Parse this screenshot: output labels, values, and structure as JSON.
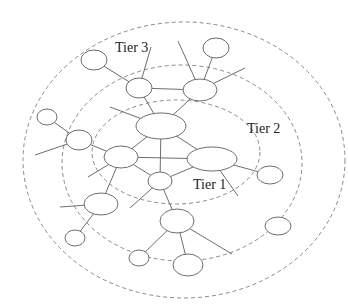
{
  "diagram": {
    "type": "tiered-network",
    "colors": {
      "background": "#ffffff",
      "node_stroke": "#6e6e6e",
      "link_stroke": "#6e6e6e",
      "ring_stroke": "#8a8a8a",
      "label": "#222222"
    },
    "tiers": [
      {
        "id": "tier1",
        "label": "Tier 1",
        "label_pos": [
          193,
          189
        ],
        "ring": {
          "cx": 176,
          "cy": 152,
          "rx": 84,
          "ry": 52
        }
      },
      {
        "id": "tier2",
        "label": "Tier 2",
        "label_pos": [
          247,
          133
        ],
        "ring": {
          "cx": 182,
          "cy": 163,
          "rx": 120,
          "ry": 98
        }
      },
      {
        "id": "tier3",
        "label": "Tier 3",
        "label_pos": [
          115,
          52
        ],
        "ring": {
          "cx": 184,
          "cy": 160,
          "rx": 161,
          "ry": 138
        }
      }
    ],
    "nodes": [
      {
        "id": "n1",
        "cx": 161,
        "cy": 126,
        "rx": 25,
        "ry": 13
      },
      {
        "id": "n2",
        "cx": 121,
        "cy": 157,
        "rx": 17,
        "ry": 11
      },
      {
        "id": "n3",
        "cx": 212,
        "cy": 159,
        "rx": 25,
        "ry": 12
      },
      {
        "id": "n4",
        "cx": 160,
        "cy": 181,
        "rx": 12,
        "ry": 9
      },
      {
        "id": "n5",
        "cx": 139,
        "cy": 88,
        "rx": 13,
        "ry": 10
      },
      {
        "id": "n6",
        "cx": 200,
        "cy": 90,
        "rx": 17,
        "ry": 11
      },
      {
        "id": "n7",
        "cx": 94,
        "cy": 60,
        "rx": 13,
        "ry": 10
      },
      {
        "id": "n8",
        "cx": 216,
        "cy": 48,
        "rx": 13,
        "ry": 10
      },
      {
        "id": "n9",
        "cx": 79,
        "cy": 140,
        "rx": 13,
        "ry": 10
      },
      {
        "id": "n10",
        "cx": 47,
        "cy": 117,
        "rx": 10,
        "ry": 8
      },
      {
        "id": "n11",
        "cx": 101,
        "cy": 204,
        "rx": 17,
        "ry": 11
      },
      {
        "id": "n12",
        "cx": 75,
        "cy": 238,
        "rx": 10,
        "ry": 8
      },
      {
        "id": "n13",
        "cx": 177,
        "cy": 221,
        "rx": 17,
        "ry": 12
      },
      {
        "id": "n14",
        "cx": 139,
        "cy": 258,
        "rx": 10,
        "ry": 8
      },
      {
        "id": "n15",
        "cx": 188,
        "cy": 265,
        "rx": 15,
        "ry": 11
      },
      {
        "id": "n16",
        "cx": 270,
        "cy": 175,
        "rx": 13,
        "ry": 9
      },
      {
        "id": "n17",
        "cx": 278,
        "cy": 226,
        "rx": 13,
        "ry": 9
      }
    ],
    "links": [
      [
        161,
        126,
        121,
        157
      ],
      [
        161,
        126,
        212,
        159
      ],
      [
        161,
        126,
        160,
        181
      ],
      [
        121,
        157,
        212,
        159
      ],
      [
        121,
        157,
        160,
        181
      ],
      [
        212,
        159,
        160,
        181
      ],
      [
        161,
        126,
        139,
        88
      ],
      [
        161,
        126,
        200,
        90
      ],
      [
        139,
        88,
        200,
        90
      ],
      [
        139,
        88,
        94,
        60
      ],
      [
        139,
        88,
        151,
        47
      ],
      [
        200,
        90,
        216,
        48
      ],
      [
        200,
        90,
        178,
        41
      ],
      [
        200,
        90,
        245,
        68
      ],
      [
        161,
        126,
        110,
        107
      ],
      [
        121,
        157,
        79,
        140
      ],
      [
        79,
        140,
        47,
        117
      ],
      [
        79,
        140,
        35,
        155
      ],
      [
        121,
        157,
        88,
        177
      ],
      [
        121,
        157,
        101,
        204
      ],
      [
        101,
        204,
        60,
        207
      ],
      [
        101,
        204,
        75,
        238
      ],
      [
        160,
        181,
        130,
        208
      ],
      [
        160,
        181,
        177,
        221
      ],
      [
        212,
        159,
        270,
        175
      ],
      [
        212,
        159,
        238,
        196
      ],
      [
        177,
        221,
        139,
        258
      ],
      [
        177,
        221,
        188,
        265
      ],
      [
        177,
        221,
        232,
        254
      ]
    ]
  }
}
